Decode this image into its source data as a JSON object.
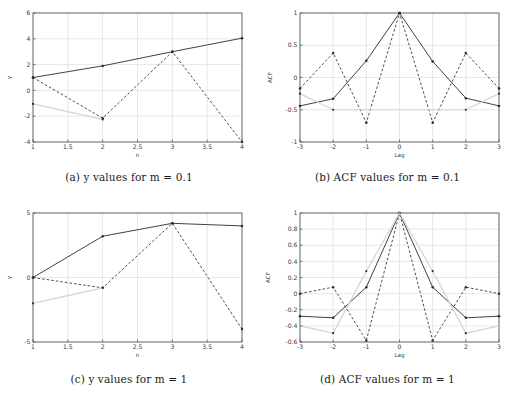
{
  "figure": {
    "background": "#ffffff",
    "axis_color": "#4d4d4d",
    "grid_color": "#d8d8d8",
    "solid_series_color": "#2b2b2b",
    "dashed_series_color": "#3a3a3a",
    "ghost_series_color": "#d4d4d4",
    "marker_color": "#2b2b2b"
  },
  "subfigures": [
    {
      "id": "a",
      "caption_prefix": "(a)",
      "caption_text_1": "y",
      "caption_text_2": "values for",
      "caption_text_3": "m",
      "caption_text_4": "= 0.1",
      "caption_full": "(a) y values for m = 0.1"
    },
    {
      "id": "b",
      "caption_prefix": "(b)",
      "caption_text_1": "ACF",
      "caption_text_2": "values for",
      "caption_text_3": "m",
      "caption_text_4": "= 0.1",
      "caption_full": "(b) ACF values for m = 0.1"
    },
    {
      "id": "c",
      "caption_prefix": "(c)",
      "caption_text_1": "y",
      "caption_text_2": "values for",
      "caption_text_3": "m",
      "caption_text_4": "= 1",
      "caption_full": "(c) y values for m = 1"
    },
    {
      "id": "d",
      "caption_prefix": "(d)",
      "caption_text_1": "ACF",
      "caption_text_2": "values for",
      "caption_text_3": "m",
      "caption_text_4": "= 1",
      "caption_full": "(d) ACF values for m = 1"
    }
  ],
  "chart_data": [
    {
      "type": "line",
      "id": "a",
      "title": "(a) y values for m = 0.1",
      "xlabel": "n",
      "ylabel": "y",
      "xlim": [
        1,
        4
      ],
      "ylim": [
        -4,
        6
      ],
      "xticks": [
        1,
        1.5,
        2,
        2.5,
        3,
        3.5,
        4
      ],
      "xticklabels": [
        "1",
        "1.5",
        "2",
        "2.5",
        "3",
        "3.5",
        "4"
      ],
      "yticks": [
        -4,
        -2,
        0,
        2,
        4,
        6
      ],
      "yticklabels": [
        "-4",
        "-2",
        "0",
        "2",
        "4",
        "6"
      ],
      "grid": true,
      "legend": "none",
      "x": [
        1,
        2,
        3,
        4
      ],
      "series": [
        {
          "name": "solid",
          "style": "solid",
          "marker": "dot",
          "values": [
            1.0,
            1.9,
            3.0,
            4.05
          ]
        },
        {
          "name": "dashed",
          "style": "dashed",
          "marker": "dot",
          "values": [
            1.0,
            -2.15,
            3.0,
            -4.0
          ]
        },
        {
          "name": "ghost",
          "style": "solid-faint",
          "marker": "dot",
          "x": [
            1,
            2
          ],
          "values": [
            -1.05,
            -2.25
          ]
        }
      ]
    },
    {
      "type": "line",
      "id": "b",
      "title": "(b) ACF values for m = 0.1",
      "xlabel": "Lag",
      "ylabel": "ACF",
      "xlim": [
        -3,
        3
      ],
      "ylim": [
        -1,
        1
      ],
      "xticks": [
        -3,
        -2,
        -1,
        0,
        1,
        2,
        3
      ],
      "xticklabels": [
        "-3",
        "-2",
        "-1",
        "0",
        "1",
        "2",
        "3"
      ],
      "yticks": [
        -1,
        -0.5,
        0,
        0.5,
        1
      ],
      "yticklabels": [
        "-1",
        "-0.5",
        "0",
        "0.5",
        "1"
      ],
      "grid": true,
      "legend": "none",
      "x": [
        -3,
        -2,
        -1,
        0,
        1,
        2,
        3
      ],
      "series": [
        {
          "name": "solid",
          "style": "solid",
          "marker": "dot",
          "values": [
            -0.44,
            -0.33,
            0.26,
            1.0,
            0.25,
            -0.32,
            -0.44
          ]
        },
        {
          "name": "dashed",
          "style": "dashed",
          "marker": "dot",
          "values": [
            -0.17,
            0.38,
            -0.7,
            1.0,
            -0.7,
            0.38,
            -0.17
          ]
        },
        {
          "name": "ghost",
          "style": "solid-faint",
          "marker": "none",
          "x": [
            -3,
            -2,
            2,
            3
          ],
          "values": [
            -0.25,
            -0.5,
            -0.5,
            -0.25
          ]
        }
      ],
      "isolated_markers": [
        {
          "x": -3,
          "y": -0.25
        },
        {
          "x": -2,
          "y": -0.5
        },
        {
          "x": 2,
          "y": -0.5
        },
        {
          "x": 3,
          "y": -0.25
        }
      ]
    },
    {
      "type": "line",
      "id": "c",
      "title": "(c) y values for m = 1",
      "xlabel": "n",
      "ylabel": "y",
      "xlim": [
        1,
        4
      ],
      "ylim": [
        -5,
        5
      ],
      "xticks": [
        1,
        1.5,
        2,
        2.5,
        3,
        3.5,
        4
      ],
      "xticklabels": [
        "1",
        "1.5",
        "2",
        "2.5",
        "3",
        "3.5",
        "4"
      ],
      "yticks": [
        -5,
        0,
        5
      ],
      "yticklabels": [
        "-5",
        "0",
        "5"
      ],
      "grid": true,
      "legend": "none",
      "x": [
        1,
        2,
        3,
        4
      ],
      "series": [
        {
          "name": "solid",
          "style": "solid",
          "marker": "dot",
          "values": [
            0.0,
            3.2,
            4.2,
            4.0
          ]
        },
        {
          "name": "dashed",
          "style": "dashed",
          "marker": "dot",
          "values": [
            0.0,
            -0.8,
            4.2,
            -4.0
          ]
        },
        {
          "name": "ghost",
          "style": "solid-faint",
          "marker": "dot",
          "x": [
            1,
            2
          ],
          "values": [
            -2.0,
            -0.8
          ]
        }
      ]
    },
    {
      "type": "line",
      "id": "d",
      "title": "(d) ACF values for m = 1",
      "xlabel": "Lag",
      "ylabel": "ACF",
      "xlim": [
        -3,
        3
      ],
      "ylim": [
        -0.6,
        1
      ],
      "xticks": [
        -3,
        -2,
        -1,
        0,
        1,
        2,
        3
      ],
      "xticklabels": [
        "-3",
        "-2",
        "-1",
        "0",
        "1",
        "2",
        "3"
      ],
      "yticks": [
        -0.6,
        -0.4,
        -0.2,
        0,
        0.2,
        0.4,
        0.6,
        0.8,
        1
      ],
      "yticklabels": [
        "-0.6",
        "-0.4",
        "-0.2",
        "0",
        "0.2",
        "0.4",
        "0.6",
        "0.8",
        "1"
      ],
      "grid": true,
      "legend": "none",
      "x": [
        -3,
        -2,
        -1,
        0,
        1,
        2,
        3
      ],
      "series": [
        {
          "name": "solid",
          "style": "solid",
          "marker": "dot",
          "values": [
            -0.28,
            -0.3,
            0.08,
            1.0,
            0.08,
            -0.3,
            -0.28
          ]
        },
        {
          "name": "dashed",
          "style": "dashed",
          "marker": "dot",
          "values": [
            0.0,
            0.08,
            -0.58,
            1.0,
            -0.58,
            0.08,
            0.0
          ]
        },
        {
          "name": "ghost",
          "style": "solid-faint",
          "marker": "none",
          "x": [
            -3,
            -2,
            -1,
            0,
            1,
            2,
            3
          ],
          "values": [
            -0.4,
            -0.49,
            0.28,
            1.0,
            0.28,
            -0.49,
            -0.4
          ]
        }
      ],
      "isolated_markers": [
        {
          "x": -2,
          "y": -0.49
        },
        {
          "x": -1,
          "y": 0.28
        },
        {
          "x": 1,
          "y": 0.28
        },
        {
          "x": 2,
          "y": -0.49
        }
      ]
    }
  ]
}
